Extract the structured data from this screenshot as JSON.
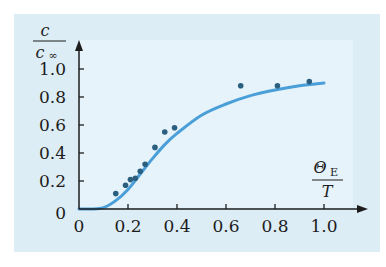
{
  "chart_data": {
    "type": "scatter",
    "title": "",
    "xlabel": "ΘE / T",
    "ylabel": "c / c∞",
    "xlim": [
      0,
      1.05
    ],
    "ylim": [
      0,
      1.1
    ],
    "x_ticks": [
      "0",
      "0.2",
      "0.4",
      "0.6",
      "0.8",
      "1.0"
    ],
    "y_ticks": [
      "0",
      "0.2",
      "0.4",
      "0.6",
      "0.8",
      "1.0"
    ],
    "grid": false,
    "legend": null,
    "series": [
      {
        "name": "measured",
        "kind": "scatter",
        "color": "#2b5f7f",
        "x": [
          0.15,
          0.19,
          0.21,
          0.23,
          0.25,
          0.27,
          0.31,
          0.35,
          0.39,
          0.66,
          0.81,
          0.94
        ],
        "y": [
          0.11,
          0.17,
          0.21,
          0.22,
          0.27,
          0.32,
          0.44,
          0.55,
          0.58,
          0.88,
          0.88,
          0.91
        ]
      },
      {
        "name": "Einstein model",
        "kind": "line",
        "color": "#4a9fd8",
        "x": [
          0,
          0.05,
          0.1,
          0.15,
          0.2,
          0.25,
          0.3,
          0.35,
          0.4,
          0.5,
          0.6,
          0.7,
          0.8,
          0.9,
          1.0
        ],
        "y": [
          0,
          0.0,
          0.01,
          0.06,
          0.14,
          0.25,
          0.36,
          0.46,
          0.54,
          0.67,
          0.75,
          0.81,
          0.85,
          0.88,
          0.9
        ]
      }
    ]
  },
  "labels": {
    "y_num": "c",
    "y_den": "c",
    "y_den_sub": "∞",
    "x_num": "Θ",
    "x_num_sub": "E",
    "x_den": "T"
  },
  "colors": {
    "panel_bg": "#dcedf5",
    "plot_bg": "#e6f3fa",
    "axis": "#1c1c1c",
    "curve": "#4a9fd8",
    "points": "#2b5f7f"
  }
}
